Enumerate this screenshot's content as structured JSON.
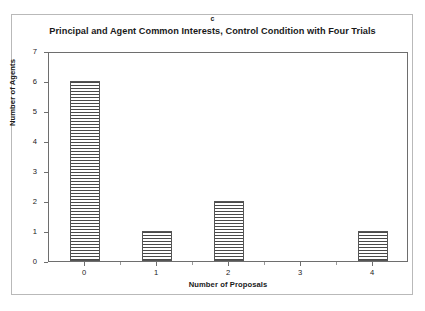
{
  "panel_label": "c",
  "chart_data": {
    "type": "bar",
    "title": "Principal and Agent Common Interests, Control Condition with Four Trials",
    "xlabel": "Number of Proposals",
    "ylabel": "Number of Agents",
    "categories": [
      "0",
      "1",
      "2",
      "3",
      "4"
    ],
    "values": [
      6,
      1,
      2,
      0,
      1
    ],
    "ylim": [
      0,
      7
    ],
    "y_ticks": [
      "0",
      "1",
      "2",
      "3",
      "4",
      "5",
      "6",
      "7"
    ],
    "grid": true,
    "legend": "none",
    "bar_fill": "horizontal-hatch",
    "bar_edge_color": "#555555",
    "axis_color": "#6e6e6e"
  }
}
